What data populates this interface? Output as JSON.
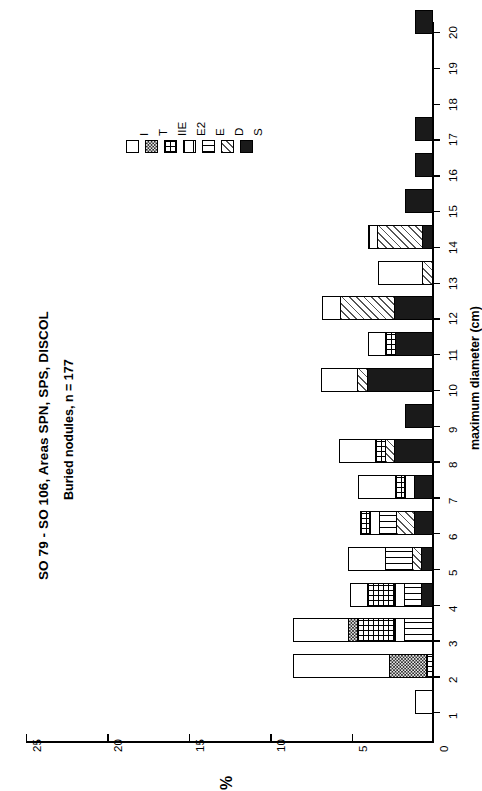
{
  "titles": {
    "main": "SO 79 - SO 106, Areas SPN, SPS, DISCOL",
    "sub": "Buried nodules, n = 177"
  },
  "axes": {
    "value_label": "%",
    "category_label": "maximum diameter (cm)",
    "value_ticks": [
      "0",
      "5",
      "10",
      "15",
      "20",
      "25"
    ],
    "category_ticks": [
      "1",
      "2",
      "3",
      "4",
      "5",
      "6",
      "7",
      "8",
      "9",
      "10",
      "11",
      "12",
      "13",
      "14",
      "15",
      "16",
      "17",
      "18",
      "19",
      "20"
    ]
  },
  "legend": {
    "entries": [
      {
        "label": "I",
        "fill": "f-I"
      },
      {
        "label": "T",
        "fill": "f-T"
      },
      {
        "label": "IIE",
        "fill": "f-IIE"
      },
      {
        "label": "E2",
        "fill": "f-E2"
      },
      {
        "label": "E",
        "fill": "f-E"
      },
      {
        "label": "D",
        "fill": "f-D"
      },
      {
        "label": "S",
        "fill": "f-S"
      }
    ]
  },
  "chart_data": {
    "type": "bar",
    "orientation": "horizontal-rotated",
    "title": "SO 79 - SO 106, Areas SPN, SPS, DISCOL",
    "subtitle": "Buried nodules, n = 177",
    "xlabel": "maximum diameter (cm)",
    "ylabel": "%",
    "ylim": [
      0,
      25
    ],
    "xlim": [
      0.5,
      20.5
    ],
    "grid": false,
    "legend_position": "upper-left",
    "stacked": true,
    "series_order": [
      "S",
      "D",
      "E",
      "E2",
      "IIE",
      "T",
      "I"
    ],
    "categories": [
      "1",
      "2",
      "3",
      "4",
      "5",
      "6",
      "7",
      "8",
      "9",
      "10",
      "11",
      "12",
      "13",
      "14",
      "15",
      "16",
      "17",
      "18",
      "19",
      "20"
    ],
    "series": [
      {
        "name": "S",
        "values": [
          0.0,
          0.0,
          0.0,
          0.6,
          0.6,
          1.1,
          1.1,
          2.3,
          1.7,
          4.0,
          2.3,
          2.3,
          0.0,
          0.6,
          1.7,
          1.1,
          1.1,
          0.0,
          0.0,
          1.1
        ]
      },
      {
        "name": "D",
        "values": [
          0.0,
          0.0,
          0.0,
          0.0,
          0.6,
          1.1,
          0.0,
          0.6,
          0.0,
          0.6,
          0.0,
          3.4,
          0.6,
          2.8,
          0.0,
          0.0,
          0.0,
          0.0,
          0.0,
          0.0
        ]
      },
      {
        "name": "E",
        "values": [
          0.0,
          0.0,
          1.7,
          1.1,
          1.7,
          1.1,
          0.0,
          0.0,
          0.0,
          0.0,
          0.0,
          0.0,
          0.0,
          0.0,
          0.0,
          0.0,
          0.0,
          0.0,
          0.0,
          0.0
        ]
      },
      {
        "name": "E2",
        "values": [
          0.0,
          0.0,
          0.6,
          0.6,
          0.0,
          0.6,
          0.6,
          0.0,
          0.0,
          0.0,
          0.0,
          0.0,
          0.0,
          0.6,
          0.0,
          0.0,
          0.0,
          0.0,
          0.0,
          0.0
        ]
      },
      {
        "name": "IIE",
        "values": [
          0.0,
          0.3,
          2.3,
          1.7,
          0.0,
          0.6,
          0.6,
          0.6,
          0.0,
          0.0,
          0.6,
          0.0,
          0.0,
          0.0,
          0.0,
          0.0,
          0.0,
          0.0,
          0.0,
          0.0
        ]
      },
      {
        "name": "T",
        "values": [
          0.0,
          2.3,
          0.6,
          0.0,
          0.0,
          0.0,
          0.0,
          0.0,
          0.0,
          0.0,
          0.0,
          0.0,
          0.0,
          0.0,
          0.0,
          0.0,
          0.0,
          0.0,
          0.0,
          0.0
        ]
      },
      {
        "name": "I",
        "values": [
          1.1,
          6.0,
          3.4,
          1.1,
          2.3,
          0.0,
          2.3,
          2.3,
          0.0,
          2.3,
          1.1,
          1.1,
          2.8,
          0.0,
          0.0,
          0.0,
          0.0,
          0.0,
          0.0,
          0.0
        ]
      }
    ],
    "totals": [
      1.1,
      8.6,
      8.6,
      5.1,
      5.2,
      4.5,
      4.6,
      5.8,
      1.7,
      6.9,
      4.0,
      6.8,
      3.4,
      4.0,
      1.7,
      1.1,
      1.1,
      0.0,
      0.0,
      1.1
    ]
  }
}
